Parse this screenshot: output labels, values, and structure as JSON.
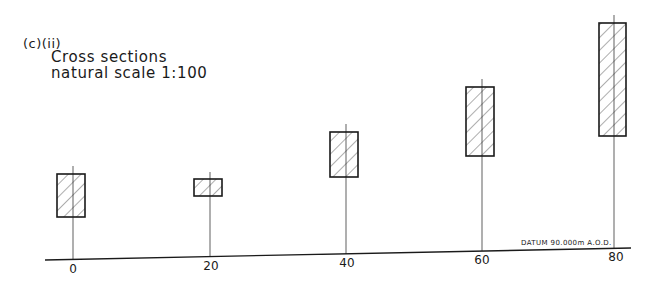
{
  "figure": {
    "part_label": "(c)(ii)",
    "title_line1": "Cross sections",
    "title_line2": "natural scale  1:100",
    "datum_note": "DATUM   90.000m   A.O.D."
  },
  "axis": {
    "ticks": [
      "0",
      "20",
      "40",
      "60",
      "80"
    ]
  },
  "sections": [
    {
      "chainage": "0",
      "rect": {
        "x": 57,
        "y": 174,
        "w": 28,
        "h": 43
      },
      "stem_x": 73,
      "stem_top": 166,
      "base_y": 260
    },
    {
      "chainage": "20",
      "rect": {
        "x": 194,
        "y": 179,
        "w": 28,
        "h": 17
      },
      "stem_x": 210,
      "stem_top": 172,
      "base_y": 257
    },
    {
      "chainage": "40",
      "rect": {
        "x": 330,
        "y": 132,
        "w": 28,
        "h": 45
      },
      "stem_x": 346,
      "stem_top": 124,
      "base_y": 254
    },
    {
      "chainage": "60",
      "rect": {
        "x": 466,
        "y": 87,
        "w": 28,
        "h": 69
      },
      "stem_x": 482,
      "stem_top": 79,
      "base_y": 251
    },
    {
      "chainage": "80",
      "rect": {
        "x": 599,
        "y": 23,
        "w": 27,
        "h": 113
      },
      "stem_x": 614,
      "stem_top": 15,
      "base_y": 248
    }
  ],
  "baseline": {
    "x1": 45,
    "y1": 260,
    "x2": 631,
    "y2": 248
  },
  "colors": {
    "ink": "#1a1a1a",
    "hatch": "#333333",
    "background": "#ffffff"
  }
}
